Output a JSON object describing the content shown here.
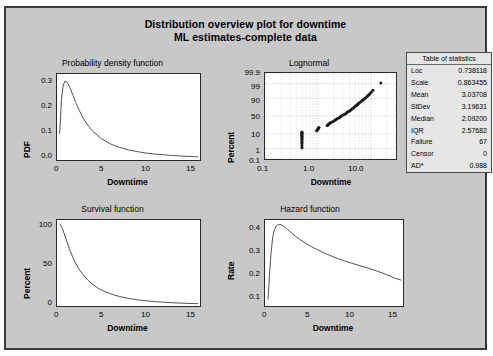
{
  "title": {
    "line1": "Distribution overview plot for downtime",
    "line2": "ML estimates-complete data"
  },
  "stats_table": {
    "header": "Table of statistics",
    "rows": [
      {
        "label": "Loc",
        "value": "0.738118"
      },
      {
        "label": "Scale",
        "value": "0.863455"
      },
      {
        "label": "Mean",
        "value": "3.03708"
      },
      {
        "label": "StDev",
        "value": "3.19631"
      },
      {
        "label": "Median",
        "value": "2.09200"
      },
      {
        "label": "IQR",
        "value": "2.57682"
      },
      {
        "label": "Failure",
        "value": "67"
      },
      {
        "label": "Censor",
        "value": "0"
      },
      {
        "label": "AD*",
        "value": "0.988"
      }
    ]
  },
  "chart_data": [
    {
      "type": "line",
      "title": "Probability density function",
      "xlabel": "Downtime",
      "ylabel": "PDF",
      "xlim": [
        0,
        16
      ],
      "ylim": [
        0,
        0.35
      ],
      "xticks": [
        "0",
        "5",
        "10",
        "15"
      ],
      "xtick_values": [
        0,
        5,
        10,
        15
      ],
      "yticks": [
        "0.0",
        "0.1",
        "0.2",
        "0.3"
      ],
      "ytick_values": [
        0.0,
        0.1,
        0.2,
        0.3
      ],
      "grid": false,
      "distribution": "lognormal",
      "loc": 0.738118,
      "scale": 0.863455,
      "x": [
        0.3,
        0.5,
        0.7,
        0.9,
        1.1,
        1.3,
        1.5,
        1.8,
        2.1,
        2.5,
        3.0,
        3.5,
        4.0,
        5.0,
        6.0,
        7.0,
        8.0,
        9.0,
        10.0,
        11.0,
        12.0,
        13.0,
        14.0,
        15.0,
        15.8
      ],
      "values": [
        0.107,
        0.248,
        0.305,
        0.321,
        0.318,
        0.306,
        0.29,
        0.262,
        0.234,
        0.201,
        0.166,
        0.139,
        0.117,
        0.086,
        0.065,
        0.051,
        0.041,
        0.034,
        0.028,
        0.024,
        0.021,
        0.018,
        0.016,
        0.014,
        0.013
      ]
    },
    {
      "type": "scatter",
      "title": "Lognormal",
      "xlabel": "Downtime",
      "ylabel": "Percent",
      "xscale": "log",
      "yscale": "probability",
      "xlim": [
        0.1,
        30
      ],
      "xticks": [
        "0.1",
        "1.0",
        "10.0"
      ],
      "xtick_values": [
        0.1,
        1.0,
        10.0
      ],
      "yticks": [
        "0.1",
        "1",
        "10",
        "50",
        "90",
        "99",
        "99.9"
      ],
      "ytick_values": [
        0.1,
        1,
        10,
        50,
        90,
        99,
        99.9
      ],
      "grid": true,
      "points": [
        {
          "x": 0.5,
          "y": 1.1
        },
        {
          "x": 0.5,
          "y": 1.6
        },
        {
          "x": 0.5,
          "y": 2.3
        },
        {
          "x": 0.5,
          "y": 3.0
        },
        {
          "x": 0.5,
          "y": 3.8
        },
        {
          "x": 0.5,
          "y": 4.6
        },
        {
          "x": 0.5,
          "y": 5.4
        },
        {
          "x": 0.5,
          "y": 6.2
        },
        {
          "x": 0.5,
          "y": 7.0
        },
        {
          "x": 0.5,
          "y": 7.9
        },
        {
          "x": 0.5,
          "y": 8.8
        },
        {
          "x": 0.5,
          "y": 9.7
        },
        {
          "x": 0.5,
          "y": 10.8
        },
        {
          "x": 0.5,
          "y": 11.8
        },
        {
          "x": 0.5,
          "y": 12.6
        },
        {
          "x": 0.95,
          "y": 14.5
        },
        {
          "x": 0.97,
          "y": 15.5
        },
        {
          "x": 1.0,
          "y": 16.8
        },
        {
          "x": 1.0,
          "y": 18.0
        },
        {
          "x": 1.02,
          "y": 19.3
        },
        {
          "x": 1.05,
          "y": 20.6
        },
        {
          "x": 1.5,
          "y": 24.5
        },
        {
          "x": 1.55,
          "y": 26.0
        },
        {
          "x": 1.6,
          "y": 27.5
        },
        {
          "x": 1.62,
          "y": 29.0
        },
        {
          "x": 1.7,
          "y": 30.5
        },
        {
          "x": 1.75,
          "y": 32.0
        },
        {
          "x": 1.9,
          "y": 34.0
        },
        {
          "x": 2.0,
          "y": 36.0
        },
        {
          "x": 2.1,
          "y": 38.0
        },
        {
          "x": 2.2,
          "y": 40.0
        },
        {
          "x": 2.3,
          "y": 42.0
        },
        {
          "x": 2.5,
          "y": 44.5
        },
        {
          "x": 2.6,
          "y": 46.5
        },
        {
          "x": 2.7,
          "y": 48.5
        },
        {
          "x": 2.8,
          "y": 50.5
        },
        {
          "x": 3.0,
          "y": 53.0
        },
        {
          "x": 3.2,
          "y": 55.0
        },
        {
          "x": 3.4,
          "y": 57.0
        },
        {
          "x": 3.5,
          "y": 59.0
        },
        {
          "x": 3.6,
          "y": 61.0
        },
        {
          "x": 3.8,
          "y": 63.0
        },
        {
          "x": 4.0,
          "y": 65.0
        },
        {
          "x": 4.2,
          "y": 67.0
        },
        {
          "x": 4.4,
          "y": 69.0
        },
        {
          "x": 4.6,
          "y": 71.0
        },
        {
          "x": 4.8,
          "y": 73.0
        },
        {
          "x": 5.0,
          "y": 75.0
        },
        {
          "x": 5.2,
          "y": 76.5
        },
        {
          "x": 5.4,
          "y": 78.0
        },
        {
          "x": 5.6,
          "y": 79.5
        },
        {
          "x": 5.8,
          "y": 81.0
        },
        {
          "x": 6.0,
          "y": 82.5
        },
        {
          "x": 6.3,
          "y": 84.0
        },
        {
          "x": 6.6,
          "y": 85.5
        },
        {
          "x": 6.9,
          "y": 86.8
        },
        {
          "x": 7.2,
          "y": 88.0
        },
        {
          "x": 7.6,
          "y": 89.2
        },
        {
          "x": 8.0,
          "y": 90.4
        },
        {
          "x": 8.4,
          "y": 91.6
        },
        {
          "x": 8.8,
          "y": 92.6
        },
        {
          "x": 9.2,
          "y": 93.6
        },
        {
          "x": 9.6,
          "y": 94.6
        },
        {
          "x": 10.2,
          "y": 95.6
        },
        {
          "x": 11.0,
          "y": 96.8
        },
        {
          "x": 15.5,
          "y": 99.1
        }
      ]
    },
    {
      "type": "line",
      "title": "Survival function",
      "xlabel": "Downtime",
      "ylabel": "Percent",
      "xlim": [
        0,
        16
      ],
      "ylim": [
        0,
        103
      ],
      "xticks": [
        "0",
        "5",
        "10",
        "15"
      ],
      "xtick_values": [
        0,
        5,
        10,
        15
      ],
      "yticks": [
        "0",
        "50",
        "100"
      ],
      "ytick_values": [
        0,
        50,
        100
      ],
      "grid": false,
      "x": [
        0.3,
        0.6,
        1.0,
        1.4,
        1.8,
        2.2,
        2.6,
        3.0,
        3.5,
        4.0,
        4.5,
        5.0,
        6.0,
        7.0,
        8.0,
        9.0,
        10.0,
        11.0,
        12.0,
        13.0,
        14.0,
        15.0,
        15.8
      ],
      "values": [
        98.5,
        93.0,
        80.5,
        68.0,
        57.5,
        49.0,
        42.0,
        36.5,
        30.5,
        25.8,
        22.0,
        19.0,
        14.5,
        11.3,
        9.1,
        7.4,
        6.2,
        5.2,
        4.5,
        3.9,
        3.4,
        3.0,
        2.8
      ]
    },
    {
      "type": "line",
      "title": "Hazard function",
      "xlabel": "Downtime",
      "ylabel": "Rate",
      "xlim": [
        0,
        16
      ],
      "ylim": [
        0.09,
        0.47
      ],
      "xticks": [
        "0",
        "5",
        "10",
        "15"
      ],
      "xtick_values": [
        0,
        5,
        10,
        15
      ],
      "yticks": [
        "0.1",
        "0.2",
        "0.3",
        "0.4"
      ],
      "ytick_values": [
        0.1,
        0.2,
        0.3,
        0.4
      ],
      "grid": false,
      "x": [
        0.35,
        0.5,
        0.7,
        0.9,
        1.1,
        1.3,
        1.6,
        1.9,
        2.2,
        2.6,
        3.0,
        3.5,
        4.0,
        4.5,
        5.0,
        6.0,
        7.0,
        8.0,
        9.0,
        10.0,
        11.0,
        12.0,
        13.0,
        14.0,
        15.0,
        15.8
      ],
      "values": [
        0.118,
        0.215,
        0.325,
        0.395,
        0.428,
        0.443,
        0.451,
        0.449,
        0.441,
        0.428,
        0.415,
        0.399,
        0.385,
        0.372,
        0.36,
        0.34,
        0.322,
        0.306,
        0.292,
        0.28,
        0.268,
        0.257,
        0.244,
        0.23,
        0.214,
        0.204
      ]
    }
  ]
}
